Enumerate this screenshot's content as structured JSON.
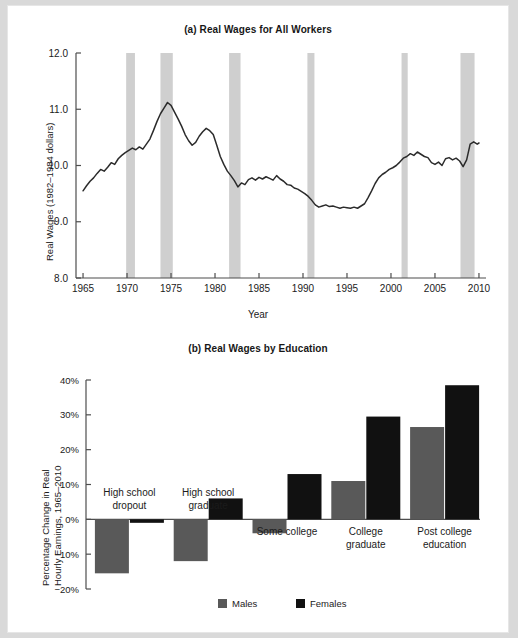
{
  "page": {
    "background": "#d9d9d9",
    "paper": "#ffffff"
  },
  "panel_a": {
    "title": "(a) Real Wages for All Workers",
    "ylabel": "Real Wages (1982–1984 dollars)",
    "xlabel": "Year"
  },
  "panel_b": {
    "title": "(b) Real Wages by Education",
    "ylabel_line1": "Percentage Change in Real",
    "ylabel_line2": "Hourly Earnings, 1965–2010"
  },
  "colors": {
    "males": "#595959",
    "females": "#111111",
    "recession_band": "#cfcfcf",
    "line": "#2b2b2b",
    "axis": "#4d4d4d",
    "text": "#1b1b1b"
  },
  "chart_data": [
    {
      "type": "line",
      "title": "(a) Real Wages for All Workers",
      "xlabel": "Year",
      "ylabel": "Real Wages (1982–1984 dollars)",
      "xlim": [
        1964.2,
        2010.8
      ],
      "ylim": [
        8.0,
        12.0
      ],
      "xticks": [
        1965,
        1970,
        1975,
        1980,
        1985,
        1990,
        1995,
        2000,
        2005,
        2010
      ],
      "yticks": [
        8.0,
        9.0,
        10.0,
        11.0,
        12.0
      ],
      "ytick_labels": [
        "8.0",
        "9.0",
        "10.0",
        "11.0",
        "12.0"
      ],
      "grid": false,
      "legend": "none",
      "annotations": [
        {
          "type": "recession_band",
          "x0": 1969.9,
          "x1": 1970.9
        },
        {
          "type": "recession_band",
          "x0": 1973.8,
          "x1": 1975.2
        },
        {
          "type": "recession_band",
          "x0": 1981.6,
          "x1": 1982.9
        },
        {
          "type": "recession_band",
          "x0": 1990.5,
          "x1": 1991.3
        },
        {
          "type": "recession_band",
          "x0": 2001.2,
          "x1": 2001.9
        },
        {
          "type": "recession_band",
          "x0": 2007.9,
          "x1": 2009.5
        }
      ],
      "series": [
        {
          "name": "Real hourly wage",
          "x": [
            1965.0,
            1965.4,
            1965.8,
            1966.2,
            1966.6,
            1967.0,
            1967.4,
            1967.8,
            1968.2,
            1968.6,
            1969.0,
            1969.4,
            1969.8,
            1970.2,
            1970.6,
            1971.0,
            1971.4,
            1971.8,
            1972.2,
            1972.6,
            1973.0,
            1973.4,
            1973.8,
            1974.2,
            1974.6,
            1975.0,
            1975.4,
            1975.8,
            1976.2,
            1976.6,
            1977.0,
            1977.4,
            1977.8,
            1978.2,
            1978.6,
            1979.0,
            1979.4,
            1979.8,
            1980.2,
            1980.6,
            1981.0,
            1981.4,
            1981.8,
            1982.2,
            1982.6,
            1983.0,
            1983.4,
            1983.8,
            1984.2,
            1984.6,
            1985.0,
            1985.4,
            1985.8,
            1986.2,
            1986.6,
            1987.0,
            1987.4,
            1987.8,
            1988.2,
            1988.6,
            1989.0,
            1989.4,
            1989.8,
            1990.2,
            1990.6,
            1991.0,
            1991.4,
            1991.8,
            1992.2,
            1992.6,
            1993.0,
            1993.4,
            1993.8,
            1994.2,
            1994.6,
            1995.0,
            1995.4,
            1995.8,
            1996.2,
            1996.6,
            1997.0,
            1997.4,
            1997.8,
            1998.2,
            1998.6,
            1999.0,
            1999.4,
            1999.8,
            2000.2,
            2000.6,
            2001.0,
            2001.4,
            2001.8,
            2002.2,
            2002.6,
            2003.0,
            2003.4,
            2003.8,
            2004.2,
            2004.6,
            2005.0,
            2005.4,
            2005.8,
            2006.2,
            2006.6,
            2007.0,
            2007.4,
            2007.8,
            2008.2,
            2008.6,
            2009.0,
            2009.4,
            2009.8,
            2010.0
          ],
          "y": [
            9.55,
            9.64,
            9.72,
            9.78,
            9.86,
            9.93,
            9.9,
            9.97,
            10.05,
            10.02,
            10.12,
            10.18,
            10.23,
            10.27,
            10.31,
            10.28,
            10.33,
            10.29,
            10.38,
            10.47,
            10.62,
            10.78,
            10.92,
            11.02,
            11.12,
            11.07,
            10.95,
            10.83,
            10.7,
            10.55,
            10.44,
            10.36,
            10.41,
            10.52,
            10.6,
            10.66,
            10.62,
            10.55,
            10.36,
            10.16,
            10.02,
            9.9,
            9.82,
            9.73,
            9.62,
            9.69,
            9.66,
            9.75,
            9.78,
            9.74,
            9.79,
            9.76,
            9.8,
            9.77,
            9.74,
            9.82,
            9.76,
            9.72,
            9.66,
            9.65,
            9.6,
            9.58,
            9.54,
            9.5,
            9.45,
            9.38,
            9.3,
            9.26,
            9.28,
            9.3,
            9.27,
            9.28,
            9.26,
            9.24,
            9.26,
            9.25,
            9.24,
            9.26,
            9.24,
            9.28,
            9.32,
            9.43,
            9.55,
            9.68,
            9.78,
            9.84,
            9.88,
            9.93,
            9.96,
            10.0,
            10.06,
            10.13,
            10.16,
            10.21,
            10.18,
            10.24,
            10.2,
            10.16,
            10.14,
            10.05,
            10.02,
            10.06,
            10.0,
            10.12,
            10.14,
            10.1,
            10.13,
            10.08,
            9.98,
            10.1,
            10.38,
            10.42,
            10.38,
            10.4
          ]
        }
      ]
    },
    {
      "type": "bar",
      "title": "(b) Real Wages by Education",
      "xlabel": "",
      "ylabel": "Percentage Change in Real Hourly Earnings, 1965–2010",
      "categories": [
        "High school dropout",
        "High school graduate",
        "Some college",
        "College graduate",
        "Post college education"
      ],
      "category_labels": [
        [
          "High school",
          "dropout"
        ],
        [
          "High school",
          "graduate"
        ],
        [
          "Some college"
        ],
        [
          "College",
          "graduate"
        ],
        [
          "Post college",
          "education"
        ]
      ],
      "series": [
        {
          "name": "Males",
          "values": [
            -15.5,
            -12.0,
            -4.0,
            11.0,
            26.5
          ]
        },
        {
          "name": "Females",
          "values": [
            -1.0,
            6.0,
            13.0,
            29.5,
            38.5
          ]
        }
      ],
      "ylim": [
        -20,
        40
      ],
      "yticks": [
        -20,
        -10,
        0,
        10,
        20,
        30,
        40
      ],
      "ytick_labels": [
        "−20%",
        "−10%",
        "0%",
        "10%",
        "20%",
        "30%",
        "40%"
      ],
      "grid": false,
      "legend": {
        "position": "bottom",
        "entries": [
          "Males",
          "Females"
        ]
      }
    }
  ],
  "legend": {
    "males": "Males",
    "females": "Females"
  }
}
